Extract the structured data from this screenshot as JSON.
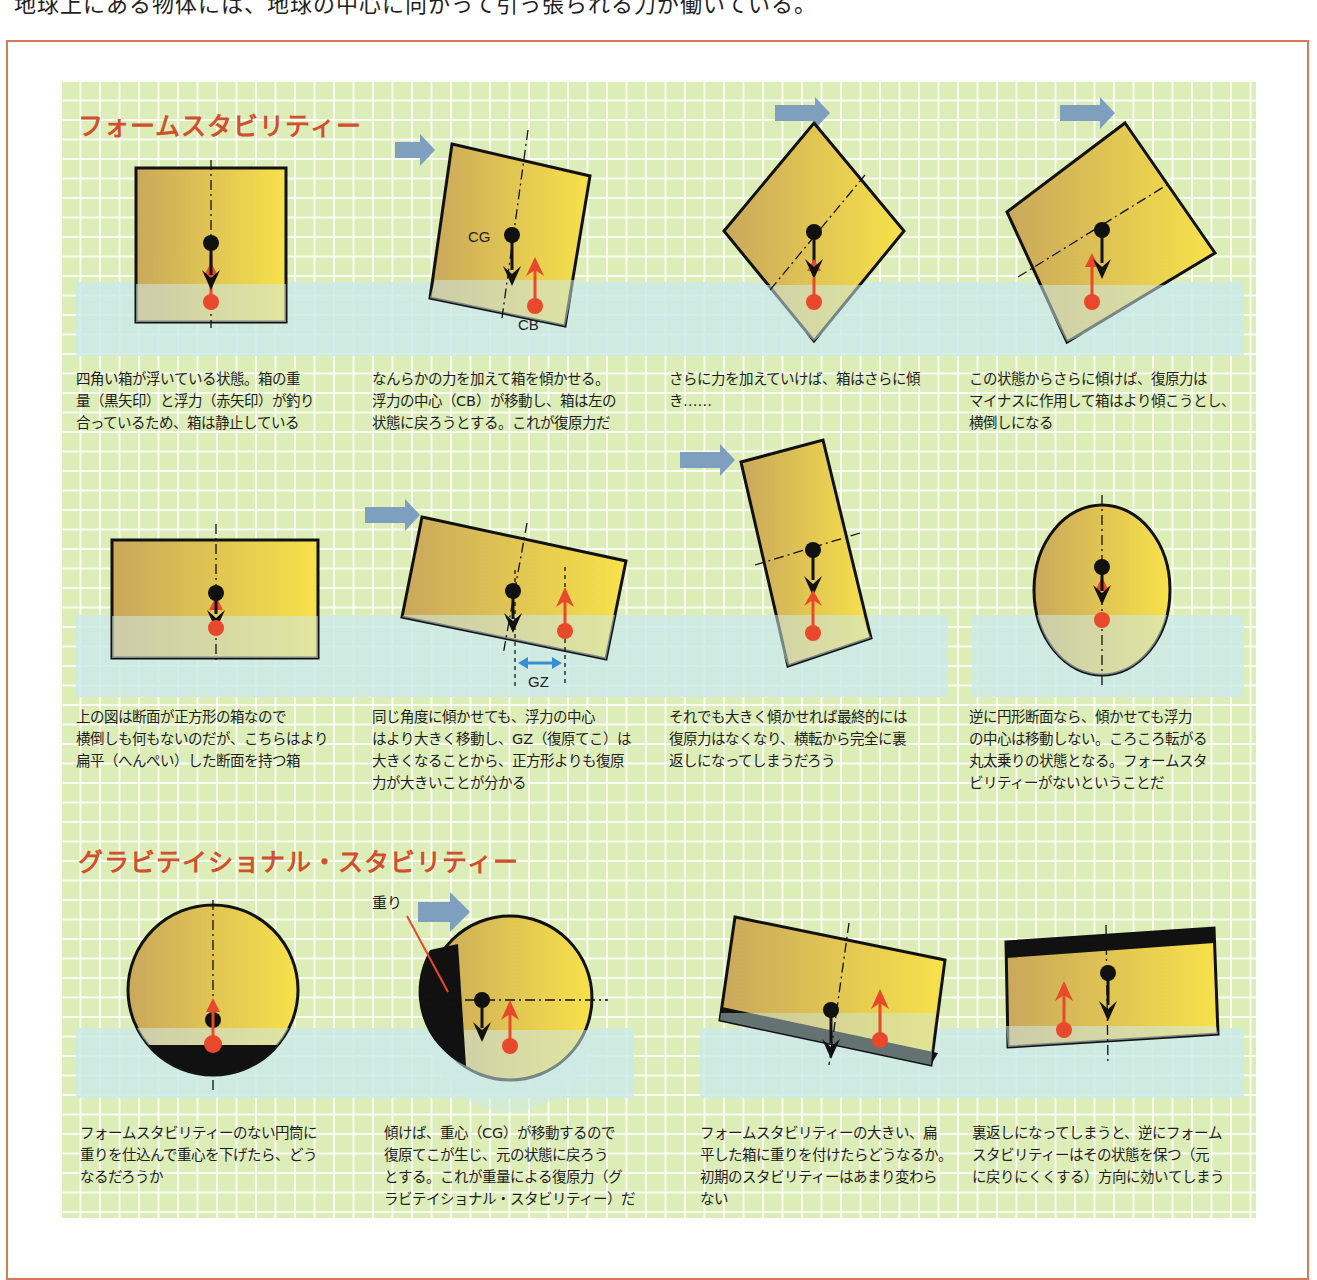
{
  "page": {
    "top_text_fragment": "地球上にある物体には、地球の中心に向かって引っ張られる力が働いている。"
  },
  "sections": [
    {
      "title": "フォームスタビリティー",
      "diagrams": [
        {
          "id": "square-upright",
          "labels": []
        },
        {
          "id": "square-tilted",
          "labels": [
            "CG",
            "CB"
          ]
        },
        {
          "id": "square-45deg",
          "labels": []
        },
        {
          "id": "square-capsizing",
          "labels": []
        },
        {
          "id": "flat-box-upright",
          "labels": []
        },
        {
          "id": "flat-box-tilted",
          "labels": [
            "GZ"
          ]
        },
        {
          "id": "flat-box-capsized",
          "labels": []
        },
        {
          "id": "circle-section",
          "labels": []
        }
      ],
      "captions": [
        "四角い箱が浮いている状態。箱の重\n量（黒矢印）と浮力（赤矢印）が釣り\n合っているため、箱は静止している",
        "なんらかの力を加えて箱を傾かせる。\n浮力の中心（CB）が移動し、箱は左の\n状態に戻ろうとする。これが復原力だ",
        "さらに力を加えていけば、箱はさらに傾\nき……",
        "この状態からさらに傾けば、復原力は\nマイナスに作用して箱はより傾こうとし、\n横倒しになる",
        "上の図は断面が正方形の箱なので\n横倒しも何もないのだが、こちらはより\n扁平（へんぺい）した断面を持つ箱",
        "同じ角度に傾かせても、浮力の中心\nはより大きく移動し、GZ（復原てこ）は\n大きくなることから、正方形よりも復原\n力が大きいことが分かる",
        "それでも大きく傾かせれば最終的には\n復原力はなくなり、横転から完全に裏\n返しになってしまうだろう",
        "逆に円形断面なら、傾かせても浮力\nの中心は移動しない。ころころ転がる\n丸太乗りの状態となる。フォームスタ\nビリティーがないということだ"
      ]
    },
    {
      "title": "グラビテイショナル・スタビリティー",
      "diagrams": [
        {
          "id": "weighted-cylinder-upright",
          "labels": []
        },
        {
          "id": "weighted-cylinder-tilted",
          "labels": [
            "重り"
          ]
        },
        {
          "id": "weighted-flat-box-tilted",
          "labels": []
        },
        {
          "id": "weighted-flat-box-inverted",
          "labels": []
        }
      ],
      "captions": [
        "フォームスタビリティーのない円筒に\n重りを仕込んで重心を下げたら、どう\nなるだろうか",
        "傾けば、重心（CG）が移動するので\n復原てこが生じ、元の状態に戻ろう\nとする。これが重量による復原力（グ\nラビテイショナル・スタビリティー）だ",
        "フォームスタビリティーの大きい、扁\n平した箱に重りを付けたらどうなるか。\n初期のスタビリティーはあまり変わら\nない",
        "裏返しになってしまうと、逆にフォーム\nスタビリティーはその状態を保つ（元\nに戻りにくくする）方向に効いてしまう"
      ]
    }
  ],
  "colors": {
    "frame_border": "#d9785a",
    "grid_bg": "#dcedb8",
    "water": "#cde9e8",
    "title": "#d0502e",
    "box_dark": "#c9a85c",
    "box_light": "#f7e24a",
    "buoyancy_red": "#e8482c",
    "weight_black": "#111111",
    "push_arrow": "#7f9fbf",
    "gz_arrow": "#3a8fd0"
  }
}
